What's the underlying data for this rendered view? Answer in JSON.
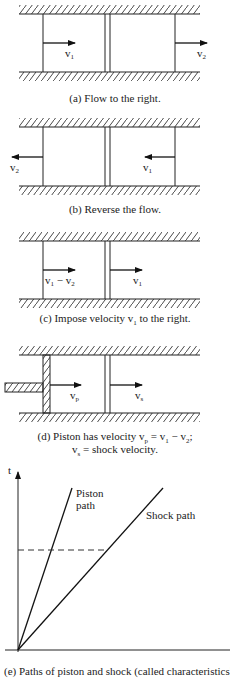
{
  "panels": [
    {
      "id": "a",
      "caption": "(a) Flow to the right.",
      "labels": [
        "v1",
        "v2"
      ]
    },
    {
      "id": "b",
      "caption": "(b) Reverse the flow.",
      "labels": [
        "v2",
        "v1"
      ]
    },
    {
      "id": "c",
      "caption": "(c) Impose velocity v1 to the right.",
      "labels": [
        "v1 − v2",
        "v1"
      ]
    },
    {
      "id": "d",
      "caption_line1": "(d) Piston has velocity vp = v1 − v2;",
      "caption_line2": "vs = shock velocity.",
      "labels": [
        "vp",
        "vs"
      ]
    },
    {
      "id": "e",
      "caption": "(e) Paths of piston and shock (called characteristics).",
      "axis_label": "t",
      "piston_label_1": "Piston",
      "piston_label_2": "path",
      "shock_label": "Shock path"
    }
  ]
}
